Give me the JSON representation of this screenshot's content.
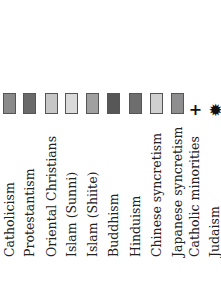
{
  "legend": {
    "entries": [
      {
        "label": "Catholicism",
        "type": "swatch",
        "color": "#8a8a8a",
        "x": 0
      },
      {
        "label": "Protestantism",
        "type": "swatch",
        "color": "#6a6a6a",
        "x": 20
      },
      {
        "label": "Oriental Christians",
        "type": "swatch",
        "color": "#c6c6c6",
        "x": 42
      },
      {
        "label": "Islam (Sunni)",
        "type": "swatch",
        "color": "#dadada",
        "x": 62
      },
      {
        "label": "Islam (Shiite)",
        "type": "swatch",
        "color": "#a0a0a0",
        "x": 83
      },
      {
        "label": "Buddhism",
        "type": "swatch",
        "color": "#575757",
        "x": 104
      },
      {
        "label": "Hinduism",
        "type": "swatch",
        "color": "#6e6e6e",
        "x": 126
      },
      {
        "label": "Chinese syncretism",
        "type": "swatch",
        "color": "#d0d0d0",
        "x": 147
      },
      {
        "label": "Japanese syncretism",
        "type": "swatch",
        "color": "#8e8e8e",
        "x": 168
      },
      {
        "label": "Catholic minorities",
        "type": "symbol",
        "symbol": "+",
        "icon": "plus-icon",
        "x": 186
      },
      {
        "label": "Judaism",
        "type": "symbol",
        "symbol": "✹",
        "icon": "star-icon",
        "x": 206
      }
    ]
  }
}
